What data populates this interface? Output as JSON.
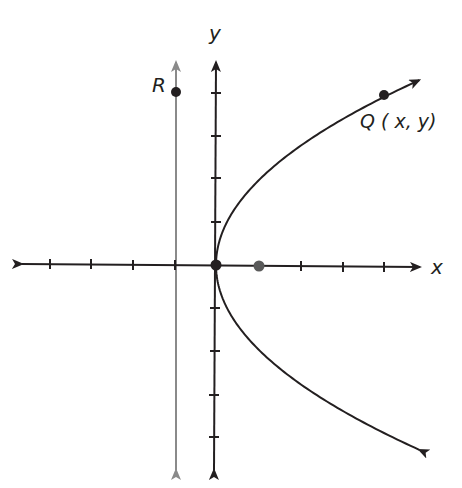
{
  "diagram": {
    "type": "parabola-focus-directrix",
    "equation": "y^2 = 4x",
    "unit_px": 42,
    "origin_px": [
      216,
      265
    ],
    "colors": {
      "axes": "#231f20",
      "curve": "#231f20",
      "directrix": "#8a8a8a",
      "focus": "#5a5a5a"
    },
    "labels": {
      "x_axis": "x",
      "y_axis": "y",
      "point_r": "R",
      "point_q": "Q ( x, y)"
    },
    "x_ticks": [
      -4,
      -3,
      -2,
      -1,
      1,
      2,
      3,
      4
    ],
    "y_ticks": [
      -4,
      -3,
      -2,
      -1,
      1,
      2,
      3,
      4
    ],
    "points": {
      "vertex": {
        "x": 0,
        "y": 0
      },
      "focus": {
        "x": 1,
        "y": 0
      },
      "Q": {
        "x": 4,
        "y": 4
      },
      "R": {
        "x": -1,
        "y": 4
      }
    },
    "directrix": {
      "x": -1
    }
  }
}
